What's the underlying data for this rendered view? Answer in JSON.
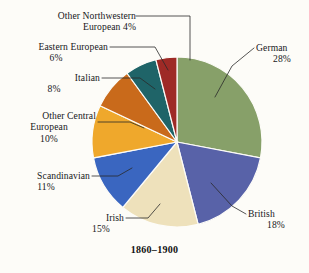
{
  "caption": "1860–1900",
  "chart_data": {
    "type": "pie",
    "title": "1860–1900",
    "xlabel": "",
    "ylabel": "",
    "units": "percent",
    "legend_position": "callout-labels",
    "grid": false,
    "start_angle_deg": 0,
    "direction": "clockwise",
    "categories": [
      "German",
      "British",
      "Irish",
      "Scandinavian",
      "Other Central European",
      "Italian",
      "Eastern European",
      "Other Northwestern European"
    ],
    "values": [
      28,
      18,
      15,
      11,
      10,
      8,
      6,
      4
    ],
    "colors": [
      "#87a069",
      "#5862a8",
      "#eee1bb",
      "#3a66c0",
      "#efa82c",
      "#c96a1b",
      "#1f6468",
      "#9e2a26"
    ],
    "slices": [
      {
        "name": "German",
        "value": 28,
        "label_line1": "German",
        "label_line2": "28%",
        "color": "#87a069",
        "align": "left"
      },
      {
        "name": "British",
        "value": 18,
        "label_line1": "British",
        "label_line2": "18%",
        "color": "#5862a8",
        "align": "left"
      },
      {
        "name": "Irish",
        "value": 15,
        "label_line1": "Irish",
        "label_line2": "15%",
        "color": "#eee1bb",
        "align": "right"
      },
      {
        "name": "Scandinavian",
        "value": 11,
        "label_line1": "Scandinavian",
        "label_line2": "11%",
        "color": "#3a66c0",
        "align": "right"
      },
      {
        "name": "Other Central European",
        "value": 10,
        "label_line1": "Other Central",
        "label_line2": "European",
        "label_line3": "10%",
        "color": "#efa82c",
        "align": "right"
      },
      {
        "name": "Italian",
        "value": 8,
        "label_line1": "Italian",
        "label_line2": "8%",
        "color": "#c96a1b",
        "align": "right"
      },
      {
        "name": "Eastern European",
        "value": 6,
        "label_line1": "Eastern European",
        "label_line2": "6%",
        "color": "#1f6468",
        "align": "right"
      },
      {
        "name": "Other Northwestern European",
        "value": 4,
        "label_line1": "Other Northwestern",
        "label_line2": "European 4%",
        "color": "#9e2a26",
        "align": "right"
      }
    ]
  }
}
